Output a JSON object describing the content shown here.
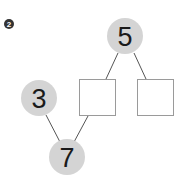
{
  "problem": {
    "number_badge": "2",
    "nodes": {
      "top": "5",
      "left": "3",
      "bottom": "7",
      "box_middle": "",
      "box_right": ""
    },
    "colors": {
      "circle_fill": "#d4d4d4",
      "box_stroke": "#9a9a9a",
      "line": "#555555",
      "badge": "#333333"
    }
  }
}
